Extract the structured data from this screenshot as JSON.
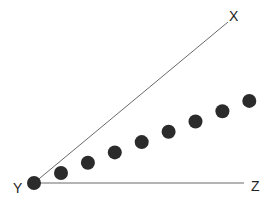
{
  "diagram": {
    "type": "angle-with-points",
    "vertex": {
      "label": "Y"
    },
    "rays": [
      {
        "name": "YX",
        "end_label": "X"
      },
      {
        "name": "YZ",
        "end_label": "Z"
      }
    ],
    "points_between_rays": 8,
    "colors": {
      "line": "#6a6a6a",
      "dot": "#2b2b2b",
      "text": "#222222",
      "background": "#ffffff"
    }
  }
}
